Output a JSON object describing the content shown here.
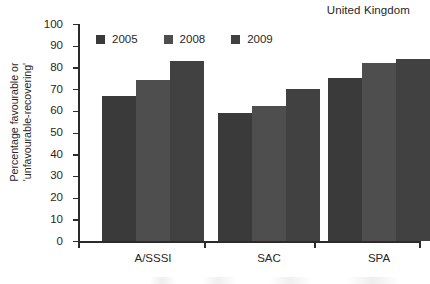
{
  "chart_data": {
    "type": "bar",
    "title": "United Kingdom",
    "xlabel": "",
    "ylabel": "Percentage favourable or 'unfavourable-recovering'",
    "ylabel_line1": "Percentage favourable or",
    "ylabel_line2": "'unfavourable-recovering'",
    "categories": [
      "A/SSSI",
      "SAC",
      "SPA"
    ],
    "series": [
      {
        "name": "2005",
        "color": "#3a3a3a",
        "values": [
          67,
          59,
          75
        ]
      },
      {
        "name": "2008",
        "color": "#4e4e4e",
        "values": [
          74,
          62,
          82
        ]
      },
      {
        "name": "2009",
        "color": "#414141",
        "values": [
          83,
          70,
          84
        ]
      }
    ],
    "ylim": [
      0,
      100
    ],
    "yticks": [
      0,
      10,
      20,
      30,
      40,
      50,
      60,
      70,
      80,
      90,
      100
    ],
    "ytick_labels": [
      "0",
      "10",
      "20",
      "30",
      "40",
      "50",
      "60",
      "70",
      "80",
      "90",
      "100"
    ],
    "grid": false,
    "legend_position": "top-left-inside",
    "axis_color": "#2b2b2b",
    "background": "#ffffff"
  }
}
